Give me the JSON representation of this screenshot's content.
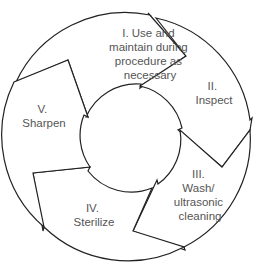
{
  "diagram": {
    "type": "cycle",
    "steps": [
      {
        "id": "I",
        "lines": [
          "I. Use and",
          "maintain during",
          "procedure as",
          "necessary"
        ]
      },
      {
        "id": "II",
        "lines": [
          "II.",
          "Inspect"
        ]
      },
      {
        "id": "III",
        "lines": [
          "III.",
          "Wash/",
          "ultrasonic",
          "cleaning"
        ]
      },
      {
        "id": "IV",
        "lines": [
          "IV.",
          "Sterilize"
        ]
      },
      {
        "id": "V",
        "lines": [
          "V.",
          "Sharpen"
        ]
      }
    ],
    "colors": {
      "stroke": "#222222",
      "text": "#555555",
      "fill": "#ffffff"
    }
  }
}
